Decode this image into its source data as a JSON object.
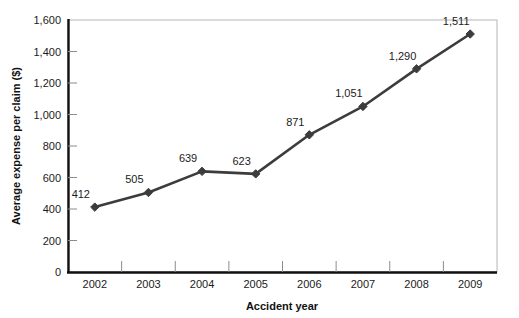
{
  "chart_data": {
    "type": "line",
    "title": "",
    "xlabel": "Accident year",
    "ylabel": "Average expense per claim ($)",
    "categories": [
      "2002",
      "2003",
      "2004",
      "2005",
      "2006",
      "2007",
      "2008",
      "2009"
    ],
    "values": [
      412,
      505,
      639,
      623,
      871,
      1051,
      1290,
      1511
    ],
    "point_labels": [
      "412",
      "505",
      "639",
      "623",
      "871",
      "1,051",
      "1,290",
      "1,511"
    ],
    "ylim": [
      0,
      1600
    ],
    "yticks": [
      0,
      200,
      400,
      600,
      800,
      1000,
      1200,
      1400,
      1600
    ],
    "ytick_labels": [
      "0",
      "200",
      "400",
      "600",
      "800",
      "1,000",
      "1,200",
      "1,400",
      "1,600"
    ],
    "grid": false,
    "legend": "none",
    "series_color": "#3c3c3c",
    "marker": "diamond",
    "axis_color": "#111111",
    "frame_color": "#b5b5b5"
  }
}
